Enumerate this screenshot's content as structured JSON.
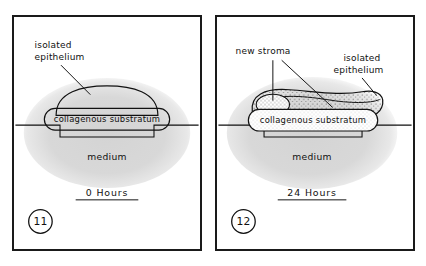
{
  "figure": {
    "background_color": "#ffffff",
    "border_color": "#1a1a1a",
    "medium_fill_color": "#d9d9d9",
    "stipple_color": "#5a5a5a",
    "panels": [
      {
        "id": "panel-11",
        "number": "11",
        "caption": "0 Hours",
        "labels": {
          "isolated_epithelium": "isolated\nepithelium",
          "isolated_epithelium_line1": "isolated",
          "isolated_epithelium_line2": "epithelium",
          "collagenous_substratum": "collagenous  substratum",
          "medium": "medium"
        },
        "structures": [
          "isolated-epithelium-dome",
          "collagenous-substratum-ellipse",
          "culture-dish-well",
          "medium-blob"
        ]
      },
      {
        "id": "panel-12",
        "number": "12",
        "caption": "24 Hours",
        "labels": {
          "new_stroma": "new stroma",
          "isolated_epithelium_line1": "isolated",
          "isolated_epithelium_line2": "epithelium",
          "collagenous_substratum": "collagenous  substratum",
          "medium": "medium"
        },
        "structures": [
          "isolated-epithelium-thickened",
          "new-stroma-oval",
          "new-stroma-stippled-region",
          "collagenous-substratum-ellipse",
          "culture-dish-well",
          "medium-blob"
        ]
      }
    ]
  }
}
